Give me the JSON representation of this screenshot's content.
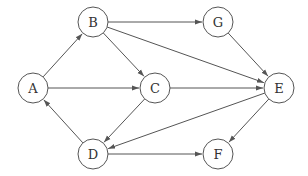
{
  "diagram": {
    "type": "directed-graph",
    "node_radius": 15,
    "stroke_color": "#555555",
    "nodes": [
      {
        "id": "A",
        "label": "A",
        "x": 33,
        "y": 88
      },
      {
        "id": "B",
        "label": "B",
        "x": 93,
        "y": 22
      },
      {
        "id": "G",
        "label": "G",
        "x": 218,
        "y": 22
      },
      {
        "id": "C",
        "label": "C",
        "x": 155,
        "y": 88
      },
      {
        "id": "E",
        "label": "E",
        "x": 279,
        "y": 88
      },
      {
        "id": "D",
        "label": "D",
        "x": 93,
        "y": 154
      },
      {
        "id": "F",
        "label": "F",
        "x": 218,
        "y": 154
      }
    ],
    "edges": [
      {
        "from": "A",
        "to": "B"
      },
      {
        "from": "A",
        "to": "C"
      },
      {
        "from": "B",
        "to": "G"
      },
      {
        "from": "B",
        "to": "E"
      },
      {
        "from": "B",
        "to": "C"
      },
      {
        "from": "G",
        "to": "E"
      },
      {
        "from": "C",
        "to": "E"
      },
      {
        "from": "C",
        "to": "D"
      },
      {
        "from": "E",
        "to": "D"
      },
      {
        "from": "E",
        "to": "F"
      },
      {
        "from": "D",
        "to": "A"
      },
      {
        "from": "D",
        "to": "F"
      }
    ]
  }
}
